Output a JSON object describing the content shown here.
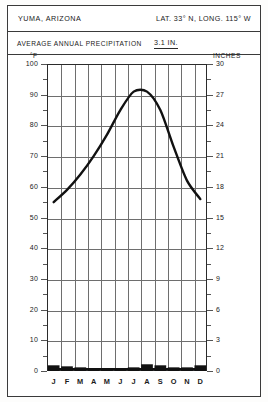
{
  "header": {
    "location": "YUMA, ARIZONA",
    "coordinates": "LAT. 33° N, LONG. 115° W",
    "precip_label": "AVERAGE  ANNUAL  PRECIPITATION",
    "precip_value": "3.1 IN."
  },
  "axes": {
    "left_caption": "°F",
    "right_caption": "INCHES",
    "left_ticks": [
      "100",
      "90",
      "80",
      "70",
      "60",
      "50",
      "40",
      "30",
      "20",
      "10",
      "0"
    ],
    "right_ticks": [
      "30",
      "27",
      "24",
      "21",
      "18",
      "15",
      "12",
      "9",
      "6",
      "3",
      "0"
    ]
  },
  "chart_data": {
    "type": "line",
    "title": "YUMA, ARIZONA",
    "subtitle": "LAT. 33° N, LONG. 115° W",
    "annotation": "AVERAGE ANNUAL PRECIPITATION 3.1 IN.",
    "xlabel": "",
    "ylabel": "°F",
    "y2label": "INCHES",
    "ylim": [
      0,
      100
    ],
    "y2lim": [
      0,
      30
    ],
    "grid": true,
    "legend": false,
    "categories": [
      "J",
      "F",
      "M",
      "A",
      "M",
      "J",
      "J",
      "A",
      "S",
      "O",
      "N",
      "D"
    ],
    "month_names": [
      "January",
      "February",
      "March",
      "April",
      "May",
      "June",
      "July",
      "August",
      "September",
      "October",
      "November",
      "December"
    ],
    "series": [
      {
        "name": "Average temperature",
        "type": "line",
        "axis": "left",
        "unit": "°F",
        "values": [
          55,
          59,
          64,
          70,
          77,
          85,
          91,
          91,
          85,
          73,
          62,
          56
        ]
      },
      {
        "name": "Average precipitation",
        "type": "bar",
        "axis": "right",
        "unit": "IN.",
        "values": [
          0.4,
          0.3,
          0.2,
          0.1,
          0.05,
          0.0,
          0.2,
          0.5,
          0.4,
          0.2,
          0.2,
          0.4
        ]
      }
    ],
    "y_tick_values": [
      0,
      10,
      20,
      30,
      40,
      50,
      60,
      70,
      80,
      90,
      100
    ],
    "y2_tick_values": [
      0,
      3,
      6,
      9,
      12,
      15,
      18,
      21,
      24,
      27,
      30
    ]
  }
}
